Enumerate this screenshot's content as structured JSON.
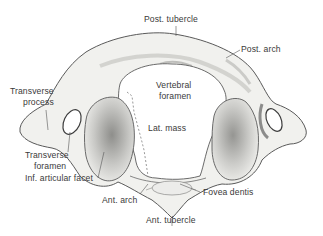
{
  "figure": {
    "colors": {
      "bone_fill": "#f1f1ee",
      "bone_outline": "#5a5a5a",
      "shading": "#a9a9a6",
      "facet_shade": "#8f8f8c",
      "label_text": "#3a3a3a",
      "leader": "#555555"
    }
  },
  "labels": {
    "post_tubercle": "Post. tubercle",
    "post_arch": "Post. arch",
    "vertebral_foramen_1": "Vertebral",
    "vertebral_foramen_2": "foramen",
    "transverse_process_1": "Transverse",
    "transverse_process_2": "process",
    "lat_mass": "Lat. mass",
    "transverse_foramen_1": "Transverse",
    "transverse_foramen_2": "foramen",
    "inf_articular_facet": "Inf. articular facet",
    "ant_arch": "Ant. arch",
    "fovea_dentis": "Fovea dentis",
    "ant_tubercle": "Ant. tubercle"
  }
}
